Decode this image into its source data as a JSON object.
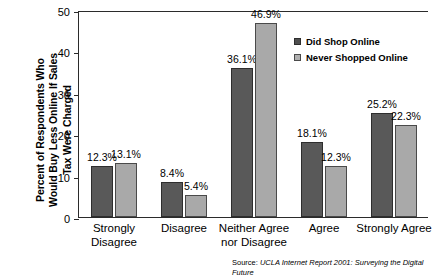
{
  "chart_data": {
    "type": "bar",
    "title": "",
    "subtitle": "",
    "xlabel": "",
    "ylabel": "Percent of Respondents Who Would Buy Less Online If Sales Tax Were Charged",
    "categories": [
      "Strongly\nDisagree",
      "Disagree",
      "Neither Agree\nnor Disagree",
      "Agree",
      "Strongly Agree"
    ],
    "series": [
      {
        "name": "Did Shop Online",
        "color": "#595959",
        "values": [
          12.3,
          8.4,
          36.1,
          18.1,
          25.2
        ],
        "labels": [
          "12.3%",
          "8.4%",
          "36.1%",
          "18.1%",
          "25.2%"
        ]
      },
      {
        "name": "Never Shopped Online",
        "color": "#a9a9a9",
        "values": [
          13.1,
          5.4,
          46.9,
          12.3,
          22.3
        ],
        "labels": [
          "13.1%",
          "5.4%",
          "46.9%",
          "12.3%",
          "22.3%"
        ]
      }
    ],
    "ylim": [
      0,
      50
    ],
    "yticks": [
      0,
      10,
      20,
      30,
      40,
      50
    ],
    "ytick_labels": [
      "0",
      "10",
      "20",
      "30",
      "40",
      "50"
    ],
    "grid": false,
    "legend_position": "upper right",
    "value_labels": true
  },
  "axis": {
    "y_title_lines": [
      "Percent of Respondents Who",
      "Would Buy Less Online If Sales",
      "Tax Were Charged"
    ]
  },
  "legend": {
    "items": [
      {
        "label": "Did Shop Online"
      },
      {
        "label": "Never Shopped Online"
      }
    ]
  },
  "source": {
    "prefix": "Source: ",
    "title": "UCLA Internet Report 2001: Surveying the Digital Future"
  }
}
